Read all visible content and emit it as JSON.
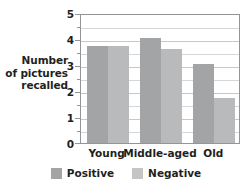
{
  "chart_data": {
    "type": "bar",
    "title": "",
    "xlabel": "",
    "ylabel_lines": [
      "Number",
      "of pictures",
      "recalled"
    ],
    "ylabel": "Number of pictures recalled",
    "categories": [
      "Young",
      "Middle-aged",
      "Old"
    ],
    "series": [
      {
        "name": "Positive",
        "values": [
          3.75,
          4.05,
          3.05
        ],
        "color": "#a3a4a6"
      },
      {
        "name": "Negative",
        "values": [
          3.75,
          3.6,
          1.75
        ],
        "color": "#b9babc"
      }
    ],
    "ylim": [
      0,
      5
    ],
    "ytick_labels": [
      "0",
      "1",
      "2",
      "3",
      "4",
      "5"
    ],
    "ytick_values": [
      0,
      1,
      2,
      3,
      4,
      5
    ],
    "minor_tick_values": [
      0.5,
      1.5,
      2.5,
      3.5,
      4.5
    ],
    "grid": true,
    "grid_interval": 0.5,
    "legend_position": "bottom",
    "legend": [
      {
        "label": "Positive",
        "color": "#a3a4a6"
      },
      {
        "label": "Negative",
        "color": "#c4c5c7"
      }
    ]
  }
}
